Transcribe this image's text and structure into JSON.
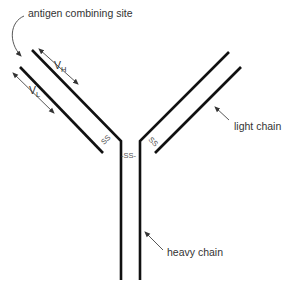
{
  "diagram": {
    "labels": {
      "antigen_site": "antigen combining site",
      "light_chain": "light chain",
      "heavy_chain": "heavy chain",
      "vh_main": "V",
      "vh_sub": "H",
      "vl_main": "V",
      "vl_sub": "L",
      "ss_left": "SS",
      "ss_center": "-SS-",
      "ss_right": "SS"
    },
    "colors": {
      "chain": "#111111",
      "text": "#333333",
      "arrow": "#444444"
    }
  }
}
